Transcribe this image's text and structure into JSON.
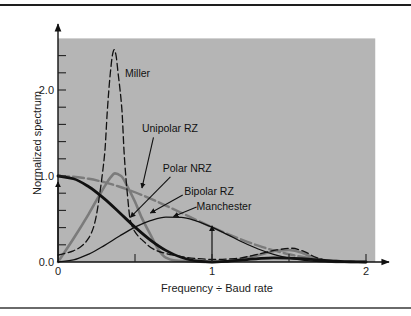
{
  "chart_data": {
    "type": "line",
    "title": "",
    "xlabel": "Frequency ÷ Baud rate",
    "ylabel": "Normalized spectrum",
    "xlim": [
      0,
      2.06
    ],
    "ylim": [
      0,
      2.6
    ],
    "grid": false,
    "legend": "none (inline labels with arrows)",
    "background_color": "#b5b5b5",
    "x_ticks": [
      {
        "value": 0,
        "label": "0"
      },
      {
        "value": 0.5,
        "label": ""
      },
      {
        "value": 1,
        "label": "1"
      },
      {
        "value": 1.5,
        "label": ""
      },
      {
        "value": 2,
        "label": "2"
      }
    ],
    "y_ticks": [
      {
        "value": 0,
        "label": "0.0"
      },
      {
        "value": 0.2,
        "label": ""
      },
      {
        "value": 0.4,
        "label": ""
      },
      {
        "value": 0.6,
        "label": ""
      },
      {
        "value": 0.8,
        "label": ""
      },
      {
        "value": 1.0,
        "label": "1.0"
      },
      {
        "value": 1.2,
        "label": ""
      },
      {
        "value": 1.4,
        "label": ""
      },
      {
        "value": 1.6,
        "label": ""
      },
      {
        "value": 1.8,
        "label": ""
      },
      {
        "value": 2.0,
        "label": "2.0"
      },
      {
        "value": 2.2,
        "label": ""
      },
      {
        "value": 2.4,
        "label": ""
      }
    ],
    "series": [
      {
        "name": "Bipolar RZ",
        "color": "#7b7b7b",
        "style": "solid-thick",
        "points": [
          [
            0,
            0
          ],
          [
            0.1,
            0.27
          ],
          [
            0.2,
            0.56
          ],
          [
            0.27,
            0.78
          ],
          [
            0.31,
            0.9
          ],
          [
            0.34,
            0.98
          ],
          [
            0.37,
            1.03
          ],
          [
            0.41,
            1.0
          ],
          [
            0.45,
            0.88
          ],
          [
            0.5,
            0.7
          ],
          [
            0.545,
            0.51
          ],
          [
            0.6,
            0.32
          ],
          [
            0.65,
            0.15
          ],
          [
            0.7,
            0.05
          ],
          [
            0.75,
            0.02
          ],
          [
            0.85,
            0.01
          ],
          [
            1.0,
            0.0
          ],
          [
            1.15,
            0.02
          ],
          [
            1.3,
            0.08
          ],
          [
            1.42,
            0.13
          ],
          [
            1.5,
            0.14
          ],
          [
            1.58,
            0.11
          ],
          [
            1.66,
            0.05
          ],
          [
            1.75,
            0.01
          ],
          [
            1.85,
            0
          ],
          [
            2.0,
            0
          ]
        ]
      },
      {
        "name": "Unipolar RZ",
        "color": "#7b7b7b",
        "style": "dashed-thick",
        "points": [
          [
            0,
            1.0
          ],
          [
            0.1,
            0.992
          ],
          [
            0.2,
            0.968
          ],
          [
            0.3,
            0.928
          ],
          [
            0.4,
            0.875
          ],
          [
            0.5,
            0.811
          ],
          [
            0.6,
            0.737
          ],
          [
            0.7,
            0.656
          ],
          [
            0.8,
            0.573
          ],
          [
            0.9,
            0.488
          ],
          [
            1.0,
            0.405
          ],
          [
            1.1,
            0.327
          ],
          [
            1.2,
            0.255
          ],
          [
            1.3,
            0.19
          ],
          [
            1.4,
            0.135
          ],
          [
            1.5,
            0.09
          ],
          [
            1.6,
            0.055
          ],
          [
            1.7,
            0.029
          ],
          [
            1.8,
            0.012
          ],
          [
            1.9,
            0.003
          ],
          [
            2.0,
            0
          ]
        ]
      },
      {
        "name": "Manchester",
        "color": "#111111",
        "style": "solid-thin",
        "points": [
          [
            0,
            0
          ],
          [
            0.1,
            0.024
          ],
          [
            0.2,
            0.092
          ],
          [
            0.3,
            0.191
          ],
          [
            0.4,
            0.302
          ],
          [
            0.5,
            0.405
          ],
          [
            0.6,
            0.482
          ],
          [
            0.7,
            0.521
          ],
          [
            0.8,
            0.518
          ],
          [
            0.9,
            0.476
          ],
          [
            1.0,
            0.405
          ],
          [
            1.1,
            0.319
          ],
          [
            1.2,
            0.23
          ],
          [
            1.3,
            0.151
          ],
          [
            1.4,
            0.089
          ],
          [
            1.5,
            0.045
          ],
          [
            1.6,
            0.019
          ],
          [
            1.7,
            0.006
          ],
          [
            1.8,
            0.001
          ],
          [
            1.9,
            0
          ],
          [
            2.0,
            0
          ]
        ]
      },
      {
        "name": "Miller",
        "color": "#111111",
        "style": "dashed-thin",
        "points": [
          [
            0,
            0.08
          ],
          [
            0.1,
            0.13
          ],
          [
            0.15,
            0.18
          ],
          [
            0.2,
            0.28
          ],
          [
            0.23,
            0.4
          ],
          [
            0.25,
            0.55
          ],
          [
            0.27,
            0.78
          ],
          [
            0.29,
            1.05
          ],
          [
            0.305,
            1.3
          ],
          [
            0.32,
            1.75
          ],
          [
            0.34,
            2.2
          ],
          [
            0.355,
            2.42
          ],
          [
            0.364,
            2.47
          ],
          [
            0.375,
            2.42
          ],
          [
            0.39,
            2.2
          ],
          [
            0.415,
            1.77
          ],
          [
            0.43,
            1.25
          ],
          [
            0.45,
            0.8
          ],
          [
            0.47,
            0.48
          ],
          [
            0.5,
            0.35
          ],
          [
            0.55,
            0.25
          ],
          [
            0.63,
            0.14
          ],
          [
            0.75,
            0.08
          ],
          [
            0.9,
            0.04
          ],
          [
            1.0,
            0.03
          ],
          [
            1.15,
            0.04
          ],
          [
            1.3,
            0.09
          ],
          [
            1.42,
            0.14
          ],
          [
            1.52,
            0.16
          ],
          [
            1.6,
            0.12
          ],
          [
            1.68,
            0.05
          ],
          [
            1.78,
            0.01
          ],
          [
            1.9,
            0
          ],
          [
            2.0,
            0
          ]
        ]
      },
      {
        "name": "Polar NRZ",
        "color": "#111111",
        "style": "solid-thick",
        "points": [
          [
            0,
            1.0
          ],
          [
            0.1,
            0.968
          ],
          [
            0.2,
            0.875
          ],
          [
            0.3,
            0.737
          ],
          [
            0.4,
            0.573
          ],
          [
            0.5,
            0.405
          ],
          [
            0.6,
            0.255
          ],
          [
            0.7,
            0.135
          ],
          [
            0.8,
            0.055
          ],
          [
            0.9,
            0.012
          ],
          [
            1.0,
            0
          ],
          [
            1.1,
            0.008
          ],
          [
            1.2,
            0.024
          ],
          [
            1.3,
            0.039
          ],
          [
            1.4,
            0.047
          ],
          [
            1.5,
            0.045
          ],
          [
            1.6,
            0.036
          ],
          [
            1.7,
            0.023
          ],
          [
            1.8,
            0.011
          ],
          [
            1.9,
            0.003
          ],
          [
            2.0,
            0
          ]
        ]
      }
    ],
    "impulses": [
      {
        "series": "Unipolar RZ",
        "x": 0,
        "y": 0.92
      },
      {
        "series": "Unipolar RZ",
        "x": 1,
        "y": 0.41
      }
    ],
    "annotations": [
      {
        "text": "Miller",
        "series": "Miller",
        "text_xy": [
          0.435,
          2.2
        ],
        "arrow_from": null,
        "arrow_to": null
      },
      {
        "text": "Unipolar RZ",
        "series": "Unipolar RZ",
        "text_xy": [
          0.545,
          1.56
        ],
        "arrow_from": [
          0.62,
          1.45
        ],
        "arrow_to": [
          0.545,
          0.86
        ]
      },
      {
        "text": "Polar NRZ",
        "series": "Polar NRZ",
        "text_xy": [
          0.68,
          1.09
        ],
        "arrow_from": [
          0.73,
          0.99
        ],
        "arrow_to": [
          0.47,
          0.52
        ]
      },
      {
        "text": "Bipolar RZ",
        "series": "Bipolar RZ",
        "text_xy": [
          0.82,
          0.83
        ],
        "arrow_from": [
          0.81,
          0.78
        ],
        "arrow_to": [
          0.6,
          0.57
        ]
      },
      {
        "text": "Manchester",
        "series": "Manchester",
        "text_xy": [
          0.9,
          0.65
        ],
        "arrow_from": [
          0.9,
          0.64
        ],
        "arrow_to": [
          0.75,
          0.53
        ]
      }
    ]
  }
}
